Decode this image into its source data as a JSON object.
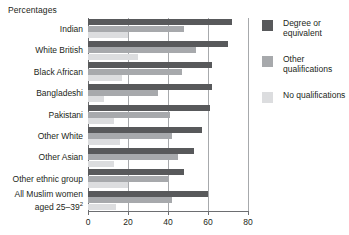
{
  "chart_data": {
    "type": "bar",
    "orientation": "horizontal",
    "title": "Percentages",
    "xlabel": "",
    "ylabel": "",
    "xlim": [
      0,
      80
    ],
    "xticks": [
      0,
      20,
      40,
      60,
      80
    ],
    "xtick_labels": [
      "0",
      "20",
      "40",
      "60",
      "80"
    ],
    "grid": true,
    "legend_position": "right",
    "categories": [
      "Indian",
      "White British",
      "Black African",
      "Bangladeshi",
      "Pakistani",
      "Other White",
      "Other Asian",
      "Other ethnic group",
      "All Muslim women aged 25–39"
    ],
    "category_footnotes": [
      "",
      "",
      "",
      "",
      "",
      "",
      "",
      "",
      "2"
    ],
    "series": [
      {
        "name": "Degree or equivalent",
        "color": "#58595b",
        "values": [
          72,
          70,
          62,
          62,
          61,
          57,
          53,
          48,
          60
        ]
      },
      {
        "name": "Other qualifications",
        "color": "#a7a9ac",
        "values": [
          48,
          54,
          47,
          35,
          41,
          42,
          45,
          40,
          42
        ]
      },
      {
        "name": "No qualifications",
        "color": "#dcdddf",
        "values": [
          20,
          25,
          17,
          8,
          13,
          16,
          13,
          20,
          14
        ]
      }
    ]
  },
  "legend": {
    "items": [
      {
        "label": "Degree or equivalent",
        "swatch": "dark-gray-swatch"
      },
      {
        "label": "Other qualifications",
        "swatch": "mid-gray-swatch"
      },
      {
        "label": "No qualifications",
        "swatch": "light-gray-swatch"
      }
    ]
  }
}
